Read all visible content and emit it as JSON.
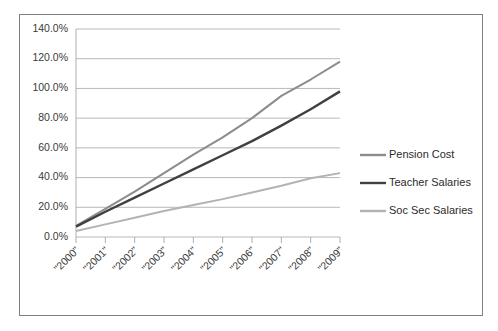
{
  "chart_data": {
    "type": "line",
    "title": "",
    "xlabel": "",
    "ylabel": "",
    "grid": true,
    "legend_position": "right",
    "ylim": [
      0,
      140
    ],
    "ytick_labels": [
      "0.0%",
      "20.0%",
      "40.0%",
      "60.0%",
      "80.0%",
      "100.0%",
      "120.0%",
      "140.0%"
    ],
    "ytick_values": [
      0,
      20,
      40,
      60,
      80,
      100,
      120,
      140
    ],
    "categories": [
      "\"2000\"",
      "\"2001\"",
      "\"2002\"",
      "\"2003\"",
      "\"2004\"",
      "\"2005\"",
      "\"2006\"",
      "\"2007\"",
      "\"2008\"",
      "\"2009\""
    ],
    "series": [
      {
        "name": "Pension Cost",
        "color": "#8c8c8c",
        "width": 2.0,
        "values": [
          7.5,
          19.0,
          30.5,
          43.0,
          55.5,
          67.0,
          80.0,
          95.0,
          106.0,
          118.0
        ]
      },
      {
        "name": "Teacher Salaries",
        "color": "#404040",
        "width": 2.4,
        "values": [
          7.0,
          17.0,
          26.5,
          36.0,
          45.5,
          55.0,
          64.5,
          75.0,
          86.0,
          98.0
        ]
      },
      {
        "name": "Soc Sec Salaries",
        "color": "#b3b3b3",
        "width": 2.0,
        "values": [
          4.0,
          8.5,
          13.0,
          17.5,
          21.5,
          25.5,
          30.0,
          34.5,
          39.5,
          43.0
        ]
      }
    ]
  },
  "legend": {
    "items": [
      {
        "label": "Pension Cost",
        "color": "#8c8c8c"
      },
      {
        "label": "Teacher Salaries",
        "color": "#404040"
      },
      {
        "label": "Soc Sec Salaries",
        "color": "#b3b3b3"
      }
    ]
  },
  "frame": {
    "border_color": "#7f7f7f",
    "background": "#ffffff"
  }
}
